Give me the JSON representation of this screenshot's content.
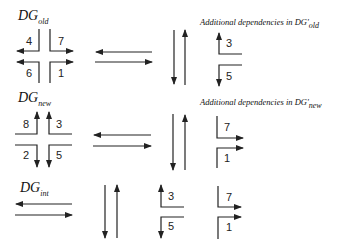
{
  "rows": [
    {
      "graph_name": "DG",
      "graph_subscript": "old",
      "cross_labels": {
        "top_left": "4",
        "top_right": "7",
        "bottom_left": "6",
        "bottom_right": "1"
      },
      "additional_title": "Additional dependencies in DG'",
      "additional_subscript": "old",
      "additional_labels": {
        "upper": "3",
        "lower": "5"
      }
    },
    {
      "graph_name": "DG",
      "graph_subscript": "new",
      "cross_labels": {
        "top_left": "8",
        "top_right": "3",
        "bottom_left": "2",
        "bottom_right": "5"
      },
      "additional_title": "Additional dependencies in DG'",
      "additional_subscript": "new",
      "additional_labels": {
        "upper": "7",
        "lower": "1"
      }
    },
    {
      "graph_name": "DG",
      "graph_subscript": "int",
      "corner_labels": {
        "a_upper": "3",
        "a_lower": "5",
        "b_upper": "7",
        "b_lower": "1"
      }
    }
  ],
  "colors": {
    "stroke": "#222222",
    "background": "#ffffff"
  }
}
